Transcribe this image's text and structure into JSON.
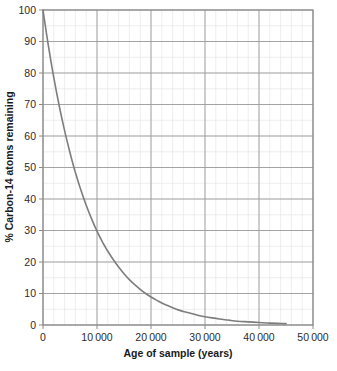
{
  "chart_data": {
    "type": "line",
    "title": "",
    "xlabel": "Age of sample (years)",
    "ylabel": "% Carbon-14 atoms remaining",
    "xlim": [
      0,
      50000
    ],
    "ylim": [
      0,
      100
    ],
    "grid": true,
    "legend": "none",
    "x_tick_labels": [
      "0",
      "10 000",
      "20 000",
      "30 000",
      "40 000",
      "50 000"
    ],
    "x_tick_values": [
      0,
      10000,
      20000,
      30000,
      40000,
      50000
    ],
    "y_tick_labels": [
      "0",
      "10",
      "20",
      "30",
      "40",
      "50",
      "60",
      "70",
      "80",
      "90",
      "100"
    ],
    "y_tick_values": [
      0,
      10,
      20,
      30,
      40,
      50,
      60,
      70,
      80,
      90,
      100
    ],
    "x_minor_interval": 2000,
    "y_minor_interval": 5,
    "series": [
      {
        "name": "Carbon-14 remaining",
        "color": "#7d7d7d",
        "x": [
          0,
          1000,
          2000,
          3000,
          4000,
          5000,
          5730,
          6000,
          7000,
          8000,
          9000,
          10000,
          11000,
          11460,
          12000,
          13000,
          14000,
          15000,
          16000,
          17000,
          17190,
          18000,
          19000,
          20000,
          21000,
          22000,
          22920,
          24000,
          25000,
          26000,
          28000,
          28650,
          30000,
          32000,
          34000,
          34380,
          36000,
          38000,
          40000,
          42000,
          44000,
          45000
        ],
        "y": [
          100.0,
          88.6,
          78.5,
          69.6,
          61.7,
          54.7,
          50.0,
          48.4,
          42.9,
          38.0,
          33.7,
          29.8,
          26.4,
          25.0,
          23.4,
          20.8,
          18.4,
          16.3,
          14.4,
          12.8,
          12.5,
          11.3,
          10.0,
          8.9,
          7.9,
          7.0,
          6.25,
          5.5,
          4.8,
          4.3,
          3.4,
          3.1,
          2.6,
          2.1,
          1.6,
          1.55,
          1.2,
          1.0,
          0.8,
          0.6,
          0.5,
          0.45
        ],
        "annotations": [
          {
            "x": 5730,
            "y": 50,
            "note": "one half-life"
          },
          {
            "x": 10000,
            "y": 30,
            "note": ""
          },
          {
            "x": 20000,
            "y": 10,
            "note": ""
          }
        ]
      }
    ]
  },
  "figure": {
    "axis_label_x": "Age of sample (years)",
    "axis_label_y": "% Carbon-14 atoms remaining"
  }
}
